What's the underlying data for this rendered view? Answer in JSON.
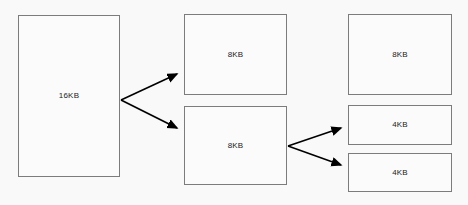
{
  "diagram": {
    "type": "memory-split-tree",
    "background_color": "#f9f9f9",
    "block_fill": "#fbfbfb",
    "block_border_color": "#7c7c7c",
    "arrow_color": "#000000",
    "text_color": "#1b1b1b",
    "columns": [
      {
        "name": "level-0",
        "blocks": [
          {
            "id": "block-16kb",
            "label": "16KB",
            "x": 18,
            "y": 15,
            "width": 102,
            "height": 162
          }
        ]
      },
      {
        "name": "level-1",
        "blocks": [
          {
            "id": "block-8kb-top",
            "label": "8KB",
            "x": 184,
            "y": 14,
            "width": 103,
            "height": 81
          },
          {
            "id": "block-8kb-bottom",
            "label": "8KB",
            "x": 184,
            "y": 106,
            "width": 103,
            "height": 79
          }
        ]
      },
      {
        "name": "level-2",
        "blocks": [
          {
            "id": "block-8kb-right",
            "label": "8KB",
            "x": 348,
            "y": 14,
            "width": 104,
            "height": 81
          },
          {
            "id": "block-4kb-top",
            "label": "4KB",
            "x": 348,
            "y": 105,
            "width": 104,
            "height": 40
          },
          {
            "id": "block-4kb-bottom",
            "label": "4KB",
            "x": 348,
            "y": 153,
            "width": 104,
            "height": 39
          }
        ]
      }
    ],
    "arrows": [
      {
        "id": "arrow-16kb-to-8kb-top",
        "from_x": 121,
        "from_y": 100,
        "to_x": 181,
        "to_y": 72
      },
      {
        "id": "arrow-16kb-to-8kb-bottom",
        "from_x": 121,
        "from_y": 100,
        "to_x": 181,
        "to_y": 130
      },
      {
        "id": "arrow-8kb-to-4kb-top",
        "from_x": 288,
        "from_y": 146,
        "to_x": 345,
        "to_y": 126
      },
      {
        "id": "arrow-8kb-to-4kb-bottom",
        "from_x": 288,
        "from_y": 146,
        "to_x": 345,
        "to_y": 167
      }
    ]
  }
}
